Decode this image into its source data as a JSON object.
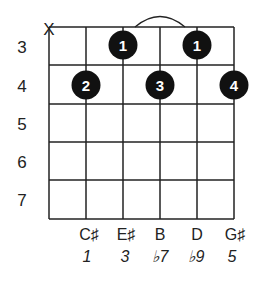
{
  "diagram": {
    "type": "guitar-chord-chart",
    "muted_string_marker": "X",
    "fret_numbers": [
      "3",
      "4",
      "5",
      "6",
      "7"
    ],
    "fingers": [
      {
        "string": 3,
        "fret": 3,
        "label": "1"
      },
      {
        "string": 5,
        "fret": 3,
        "label": "1"
      },
      {
        "string": 2,
        "fret": 4,
        "label": "2"
      },
      {
        "string": 4,
        "fret": 4,
        "label": "3"
      },
      {
        "string": 6,
        "fret": 4,
        "label": "4"
      }
    ],
    "barre": {
      "from_string": 3,
      "to_string": 5,
      "fret": 3
    },
    "notes": [
      "C♯",
      "E♯",
      "B",
      "D",
      "G♯"
    ],
    "degrees": [
      "1",
      "3",
      "♭7",
      "♭9",
      "5"
    ],
    "colors": {
      "line": "#222222",
      "dot": "#111111",
      "dot_text": "#ffffff"
    }
  }
}
